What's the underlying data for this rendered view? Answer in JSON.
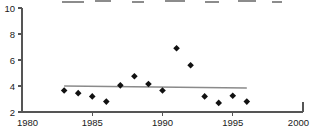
{
  "chart_data": {
    "type": "scatter",
    "title": "",
    "xlabel": "",
    "ylabel": "",
    "xlim": [
      1980,
      2000
    ],
    "ylim": [
      2,
      10
    ],
    "grid": false,
    "legend": null,
    "x_ticks": [
      1980,
      1985,
      1990,
      1995,
      2000
    ],
    "x_tick_labels": [
      "1980",
      "1985",
      "1990",
      "1995",
      "2000"
    ],
    "y_ticks": [
      2,
      4,
      6,
      8,
      10
    ],
    "y_tick_labels": [
      "2",
      "4",
      "6",
      "8",
      "10"
    ],
    "series": [
      {
        "name": "observations",
        "marker": "diamond",
        "color": "#111111",
        "x": [
          1983,
          1984,
          1985,
          1986,
          1987,
          1988,
          1989,
          1990,
          1991,
          1992,
          1993,
          1994,
          1995,
          1996
        ],
        "values": [
          3.65,
          3.45,
          3.2,
          2.8,
          4.05,
          4.75,
          4.15,
          3.65,
          6.9,
          5.6,
          3.2,
          2.7,
          3.25,
          2.8
        ]
      },
      {
        "name": "trend-line",
        "marker": "none",
        "color": "#8a8a8a",
        "x": [
          1983,
          1996
        ],
        "values": [
          4.0,
          3.85
        ]
      }
    ]
  },
  "axes": {
    "y_axis_name": "value-axis",
    "x_axis_name": "year-axis"
  }
}
